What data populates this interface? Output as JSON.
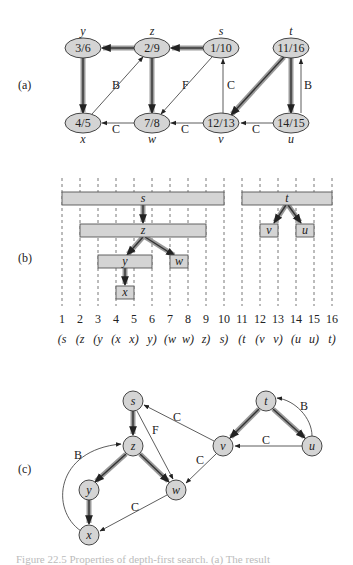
{
  "figure": {
    "caption": "Figure 22.5  Properties of depth-first search. (a) The result",
    "panels": {
      "a": {
        "label": "(a)",
        "nodes": [
          {
            "id": "y",
            "name": "y",
            "times": "3/6"
          },
          {
            "id": "z",
            "name": "z",
            "times": "2/9"
          },
          {
            "id": "s",
            "name": "s",
            "times": "1/10"
          },
          {
            "id": "t",
            "name": "t",
            "times": "11/16"
          },
          {
            "id": "x",
            "name": "x",
            "times": "4/5"
          },
          {
            "id": "w",
            "name": "w",
            "times": "7/8"
          },
          {
            "id": "v",
            "name": "v",
            "times": "12/13"
          },
          {
            "id": "u",
            "name": "u",
            "times": "14/15"
          }
        ],
        "edge_labels": {
          "x_z": "B",
          "s_w": "F",
          "v_s": "C",
          "u_t": "B",
          "w_x": "C",
          "v_w": "C",
          "u_v": "C"
        }
      },
      "b": {
        "label": "(b)",
        "ticks": [
          "1",
          "2",
          "3",
          "4",
          "5",
          "6",
          "7",
          "8",
          "9",
          "10",
          "11",
          "12",
          "13",
          "14",
          "15",
          "16"
        ],
        "parens": [
          "(s",
          "(z",
          "(y",
          "(x",
          "x)",
          "y)",
          "(w",
          "w)",
          "z)",
          "s)",
          "(t",
          "(v",
          "v)",
          "(u",
          "u)",
          "t)"
        ],
        "intervals": [
          {
            "name": "s",
            "start": 1,
            "end": 10
          },
          {
            "name": "z",
            "start": 2,
            "end": 9
          },
          {
            "name": "y",
            "start": 3,
            "end": 6
          },
          {
            "name": "w",
            "start": 7,
            "end": 8
          },
          {
            "name": "x",
            "start": 4,
            "end": 5
          },
          {
            "name": "t",
            "start": 11,
            "end": 16
          },
          {
            "name": "v",
            "start": 12,
            "end": 13
          },
          {
            "name": "u",
            "start": 14,
            "end": 15
          }
        ]
      },
      "c": {
        "label": "(c)",
        "nodes": {
          "s": "s",
          "z": "z",
          "y": "y",
          "x": "x",
          "w": "w",
          "t": "t",
          "v": "v",
          "u": "u"
        },
        "edge_labels": {
          "x_z": "B",
          "s_w": "F",
          "v_s": "C",
          "u_t": "B",
          "u_v": "C",
          "v_w": "C",
          "w_x": "C"
        }
      }
    },
    "colors": {
      "node_fill": "#d4d4d4",
      "tree_edge_halo": "#9a9a9a",
      "stroke": "#333333"
    }
  }
}
